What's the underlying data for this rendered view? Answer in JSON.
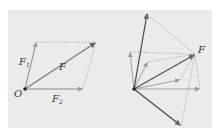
{
  "diagram": {
    "left": {
      "origin_label": "O",
      "vectors": [
        {
          "name": "F1",
          "label": "F",
          "subscript": "1"
        },
        {
          "name": "F2",
          "label": "F",
          "subscript": "2"
        },
        {
          "name": "F",
          "label": "F",
          "subscript": ""
        }
      ]
    },
    "right": {
      "resultant_label": "F",
      "description": "Multiple pairs of component forces composing the same resultant F"
    },
    "colors": {
      "panel": "#ebebeb",
      "resultant": "#555555",
      "component": "#8a8a8a",
      "dashed": "#a0a0a0"
    }
  }
}
